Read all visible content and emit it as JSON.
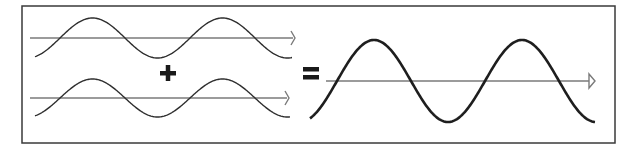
{
  "diagram": {
    "operators": {
      "plus": "+",
      "equals": "="
    },
    "colors": {
      "frame": "#3a3a3a",
      "axis": "#7a7a7a",
      "wave": "#1e1e1e",
      "background": "#ffffff"
    },
    "frame": {
      "x": 22,
      "y": 6,
      "width": 593,
      "height": 137
    },
    "waves": [
      {
        "name": "wave-a",
        "axis_y": 38,
        "axis_x_start": 30,
        "axis_x_end": 295,
        "x_start": 35,
        "x_end": 292,
        "amplitude": 20,
        "period": 130,
        "phase_zero_x": 60,
        "stroke": "thin"
      },
      {
        "name": "wave-b",
        "axis_y": 98,
        "axis_x_start": 30,
        "axis_x_end": 289,
        "x_start": 35,
        "x_end": 290,
        "amplitude": 19,
        "period": 130,
        "phase_zero_x": 60,
        "stroke": "thin"
      },
      {
        "name": "wave-sum",
        "axis_y": 81,
        "axis_x_start": 326,
        "axis_x_end": 595,
        "x_start": 310,
        "x_end": 595,
        "amplitude": 41,
        "period": 148,
        "phase_zero_x": 337,
        "stroke": "thick"
      }
    ]
  }
}
